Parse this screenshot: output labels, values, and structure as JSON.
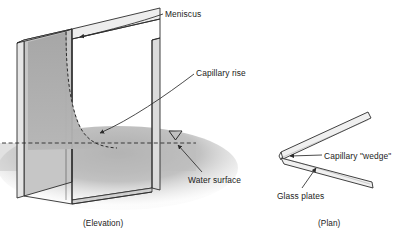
{
  "figure": {
    "labels": {
      "meniscus": "Meniscus",
      "capillary_rise": "Capillary rise",
      "water_surface": "Water surface",
      "capillary_wedge": "Capillary \"wedge\"",
      "glass_plates": "Glass plates"
    },
    "captions": {
      "elevation": "(Elevation)",
      "plan": "(Plan)"
    },
    "colors": {
      "background": "#ffffff",
      "stroke": "#2b2b2b",
      "plate_face": "#c9c9c9",
      "plate_edge": "#e8e8e8",
      "water_fill": "#b9b9b9",
      "capillary_fill": "#aeaeae",
      "text": "#1b1b1b"
    },
    "markers": {
      "water_level_symbol": "water-level-triangle",
      "water_level_style": "dashed"
    }
  }
}
